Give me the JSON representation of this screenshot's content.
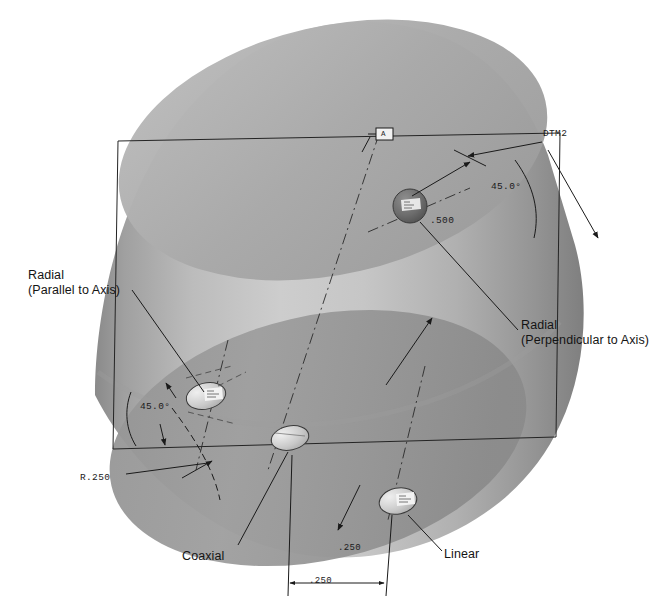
{
  "drawing": {
    "title": "Hole Placement Dimensioning Schemes on a Cylinder",
    "subject": "cylinder",
    "background_color": "#ffffff",
    "line_color": "#1a1a1a",
    "body_light_color": "#c9c9c9",
    "body_mid_color": "#a8a8a8",
    "body_dark_color": "#8d8d8d",
    "top_cap_color": "#b4b4b4",
    "bottom_region_color": "#9a9a9a"
  },
  "feature_labels": [
    {
      "id": "radial-parallel",
      "line1": "Radial",
      "line2": "(Parallel to Axis)",
      "x": 28,
      "y": 268
    },
    {
      "id": "radial-perpendicular",
      "line1": "Radial",
      "line2": "(Perpendicular to Axis)",
      "x": 521,
      "y": 318
    },
    {
      "id": "coaxial",
      "line1": "Coaxial",
      "line2": "",
      "x": 182,
      "y": 549
    },
    {
      "id": "linear",
      "line1": "Linear",
      "line2": "",
      "x": 444,
      "y": 547
    }
  ],
  "dimensions": [
    {
      "id": "datum-dtm2",
      "text": "DTM2",
      "x": 543,
      "y": 128
    },
    {
      "id": "angle-upper-right",
      "text": "45.0°",
      "x": 491,
      "y": 181
    },
    {
      "id": "depth-500",
      "text": ".500",
      "x": 430,
      "y": 215
    },
    {
      "id": "angle-left",
      "text": "45.0°",
      "x": 140,
      "y": 401
    },
    {
      "id": "radius-r250",
      "text": "R.250",
      "x": 80,
      "y": 472
    },
    {
      "id": "offset-250",
      "text": ".250",
      "x": 338,
      "y": 543
    },
    {
      "id": "width-250",
      "text": ".250",
      "x": 309,
      "y": 578
    }
  ],
  "datum_flag": {
    "id": "datum-flag-top",
    "text": "A",
    "x": 383,
    "y": 133
  },
  "holes": [
    {
      "id": "hole-radial-perpendicular",
      "cx": 410,
      "cy": 206,
      "rx": 16,
      "ry": 16,
      "type": "sphere-dark"
    },
    {
      "id": "hole-radial-parallel",
      "cx": 206,
      "cy": 396,
      "rx": 19,
      "ry": 12,
      "type": "ellipse-light"
    },
    {
      "id": "hole-coaxial",
      "cx": 290,
      "cy": 438,
      "rx": 18,
      "ry": 12,
      "type": "ellipse-light"
    },
    {
      "id": "hole-linear",
      "cx": 398,
      "cy": 501,
      "rx": 18,
      "ry": 13,
      "type": "ellipse-light"
    }
  ]
}
